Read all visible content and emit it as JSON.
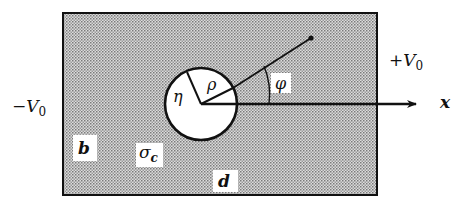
{
  "diagram": {
    "labels": {
      "minus_v": "−V",
      "minus_v_sub": "0",
      "plus_v": "+V",
      "plus_v_sub": "0",
      "x_axis": "x",
      "phi": "φ",
      "eta": "η",
      "rho": "ρ",
      "b": "b",
      "sigma": "σ",
      "sigma_sub": "c",
      "d": "d"
    },
    "colors": {
      "background": "#ffffff",
      "stipple_dark": "#8a8a8a",
      "stipple_light": "#e6e6e6",
      "stroke": "#111111"
    }
  }
}
